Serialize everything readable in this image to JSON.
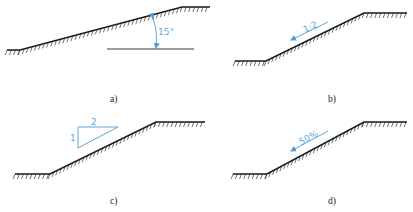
{
  "figure": {
    "colors": {
      "line": "#1a1a1a",
      "annotation": "#4a9fd6"
    },
    "panels": [
      {
        "id": "a",
        "caption": "a)",
        "notation": "angle",
        "annotation_text": "15°",
        "profile": [
          [
            7,
            50
          ],
          [
            20,
            50
          ],
          [
            182,
            7
          ],
          [
            210,
            7
          ]
        ]
      },
      {
        "id": "b",
        "caption": "b)",
        "notation": "ratio",
        "annotation_text": "1:2",
        "profile": [
          [
            235,
            61
          ],
          [
            266,
            61
          ],
          [
            364,
            13
          ],
          [
            407,
            13
          ]
        ]
      },
      {
        "id": "c",
        "caption": "c)",
        "notation": "triangle",
        "triangle_vertical_label": "1",
        "triangle_horizontal_label": "2",
        "profile": [
          [
            15,
            174
          ],
          [
            50,
            174
          ],
          [
            156,
            122
          ],
          [
            205,
            122
          ]
        ]
      },
      {
        "id": "d",
        "caption": "d)",
        "notation": "percentage",
        "annotation_text": "50%",
        "profile": [
          [
            233,
            174
          ],
          [
            267,
            174
          ],
          [
            364,
            122
          ],
          [
            407,
            122
          ]
        ]
      }
    ]
  }
}
